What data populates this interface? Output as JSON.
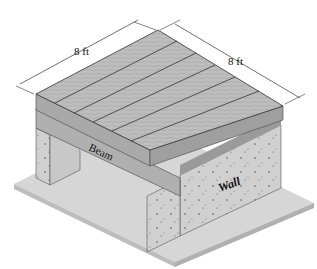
{
  "diagram": {
    "dimensions": [
      {
        "label": "8 ft",
        "side": "left"
      },
      {
        "label": "8 ft",
        "side": "right"
      }
    ],
    "labels": {
      "beam": "Beam",
      "wall": "Wall"
    },
    "colors": {
      "deck_top": "#b9b9b9",
      "deck_side": "#a8a8a8",
      "concrete": "#cfcfcf",
      "slab": "#d6d6d6",
      "line": "#333333"
    }
  }
}
